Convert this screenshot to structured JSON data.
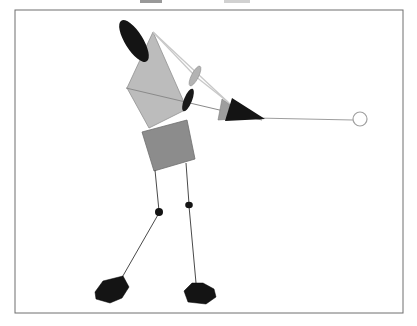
{
  "canvas": {
    "width": 417,
    "height": 326,
    "background": "#ffffff"
  },
  "figure": {
    "type": "golfer-stick-figure-diagram",
    "palette": {
      "frame_stroke": "#6e6e6e",
      "torso_fill": "#bcbcbc",
      "hip_fill": "#8c8c8c",
      "black_fill": "#141414",
      "light_line": "#c8c8c8",
      "arm_line": "#8a8a8a",
      "shaft_line": "#9e9e9e",
      "leg_line": "#4a4a4a",
      "ball_stroke": "#a0a0a0"
    },
    "shapes": [
      {
        "name": "figure-frame",
        "tag": "rect",
        "attrs": {
          "x": 15,
          "y": 10,
          "width": 388,
          "height": 303,
          "fill": "#ffffff",
          "stroke": "#6e6e6e",
          "stroke-width": 1
        }
      },
      {
        "name": "torso-polygon",
        "tag": "polygon",
        "attrs": {
          "points": "153,32 127,88 149,128 187,109",
          "fill": "#bcbcbc",
          "stroke": "#909090",
          "stroke-width": 0.8
        }
      },
      {
        "name": "hip-polygon",
        "tag": "polygon",
        "attrs": {
          "points": "142,132 187,120 195,159 154,171",
          "fill": "#8c8c8c",
          "stroke": "#6f6f6f",
          "stroke-width": 0.8
        }
      },
      {
        "name": "far-arm-line",
        "tag": "line",
        "attrs": {
          "x1": 126,
          "y1": 88,
          "x2": 262,
          "y2": 120,
          "stroke": "#8a8a8a",
          "stroke-width": 1
        }
      },
      {
        "name": "near-arm-line",
        "tag": "line",
        "attrs": {
          "x1": 153,
          "y1": 32,
          "x2": 230,
          "y2": 104,
          "stroke": "#c8c8c8",
          "stroke-width": 1.3
        }
      },
      {
        "name": "upper-arm-light-line",
        "tag": "line",
        "attrs": {
          "x1": 153,
          "y1": 32,
          "x2": 195,
          "y2": 76,
          "stroke": "#c8c8c8",
          "stroke-width": 1.3
        }
      },
      {
        "name": "forearm-light-line",
        "tag": "line",
        "attrs": {
          "x1": 195,
          "y1": 76,
          "x2": 228,
          "y2": 102,
          "stroke": "#c8c8c8",
          "stroke-width": 1.3
        }
      },
      {
        "name": "club-shaft-line",
        "tag": "line",
        "attrs": {
          "x1": 256,
          "y1": 118,
          "x2": 353,
          "y2": 120,
          "stroke": "#9e9e9e",
          "stroke-width": 1.2
        }
      },
      {
        "name": "head-ellipse",
        "tag": "ellipse",
        "attrs": {
          "cx": 134,
          "cy": 41,
          "rx": 9,
          "ry": 24,
          "transform": "rotate(-32 134 41)",
          "fill": "#141414"
        }
      },
      {
        "name": "elbow-ellipse",
        "tag": "ellipse",
        "attrs": {
          "cx": 195,
          "cy": 76,
          "rx": 3.5,
          "ry": 11,
          "transform": "rotate(27 195 76)",
          "fill": "#b3b3b3",
          "stroke": "#8f8f8f",
          "stroke-width": 0.6
        }
      },
      {
        "name": "hand-ellipse",
        "tag": "ellipse",
        "attrs": {
          "cx": 188,
          "cy": 100,
          "rx": 4,
          "ry": 12,
          "transform": "rotate(22 188 100)",
          "fill": "#1a1a1a"
        }
      },
      {
        "name": "clubhead-gray-triangle",
        "tag": "polygon",
        "attrs": {
          "points": "222,99 218,120 248,118",
          "fill": "#9e9e9e",
          "stroke": "#7d7d7d",
          "stroke-width": 0.6
        }
      },
      {
        "name": "clubhead-black-triangle",
        "tag": "polygon",
        "attrs": {
          "points": "232,98 225,121 265,119",
          "fill": "#141414"
        }
      },
      {
        "name": "ball-circle",
        "tag": "circle",
        "attrs": {
          "cx": 360,
          "cy": 119,
          "r": 7,
          "fill": "#ffffff",
          "stroke": "#a0a0a0",
          "stroke-width": 1.2
        }
      },
      {
        "name": "left-thigh-line",
        "tag": "line",
        "attrs": {
          "x1": 155,
          "y1": 170,
          "x2": 159,
          "y2": 211,
          "stroke": "#4a4a4a",
          "stroke-width": 1
        }
      },
      {
        "name": "left-shin-line",
        "tag": "line",
        "attrs": {
          "x1": 159,
          "y1": 213,
          "x2": 120,
          "y2": 281,
          "stroke": "#4a4a4a",
          "stroke-width": 1
        }
      },
      {
        "name": "right-thigh-line",
        "tag": "line",
        "attrs": {
          "x1": 186,
          "y1": 163,
          "x2": 189,
          "y2": 204,
          "stroke": "#4a4a4a",
          "stroke-width": 1
        }
      },
      {
        "name": "right-shin-line",
        "tag": "line",
        "attrs": {
          "x1": 189,
          "y1": 206,
          "x2": 196,
          "y2": 283,
          "stroke": "#4a4a4a",
          "stroke-width": 1
        }
      },
      {
        "name": "left-knee-dot",
        "tag": "ellipse",
        "attrs": {
          "cx": 159,
          "cy": 212,
          "rx": 4,
          "ry": 4,
          "fill": "#141414"
        }
      },
      {
        "name": "right-knee-dot",
        "tag": "ellipse",
        "attrs": {
          "cx": 189,
          "cy": 205,
          "rx": 3.8,
          "ry": 3.2,
          "fill": "#141414"
        }
      },
      {
        "name": "left-foot-polygon",
        "tag": "polygon",
        "attrs": {
          "points": "103,281 123,276 129,287 122,298 110,303 96,299 95,292",
          "fill": "#141414",
          "stroke": "#000000",
          "stroke-width": 0.5
        }
      },
      {
        "name": "right-foot-polygon",
        "tag": "polygon",
        "attrs": {
          "points": "192,283 203,283 214,289 216,297 206,304 188,302 184,291",
          "fill": "#141414",
          "stroke": "#000000",
          "stroke-width": 0.5
        }
      }
    ]
  },
  "artifacts": [
    {
      "name": "cropped-caption-fragment-left",
      "x": 140,
      "y": 0,
      "width": 22,
      "height": 3,
      "color": "rgba(70,70,70,0.55)"
    },
    {
      "name": "cropped-caption-fragment-right",
      "x": 224,
      "y": 0,
      "width": 26,
      "height": 3,
      "color": "rgba(140,140,140,0.40)"
    }
  ]
}
